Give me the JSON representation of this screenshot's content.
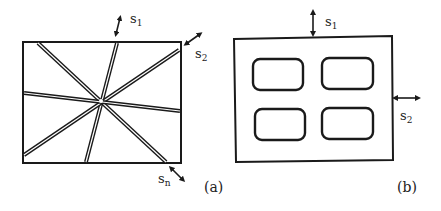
{
  "panels": [
    {
      "id": "a",
      "caption": "(a)",
      "labels": {
        "s1": {
          "base": "s",
          "sub": "1"
        },
        "s2": {
          "base": "s",
          "sub": "2"
        },
        "sn": {
          "base": "s",
          "sub": "n"
        }
      },
      "description": "Rectangle crossed by four double-line strips radiating through a common center"
    },
    {
      "id": "b",
      "caption": "(b)",
      "labels": {
        "s1": {
          "base": "s",
          "sub": "1"
        },
        "s2": {
          "base": "s",
          "sub": "2"
        }
      },
      "description": "Rectangle containing a 2x2 grid of rounded-rectangle holes"
    }
  ],
  "colors": {
    "stroke": "#1a1a1a",
    "background": "#ffffff"
  }
}
